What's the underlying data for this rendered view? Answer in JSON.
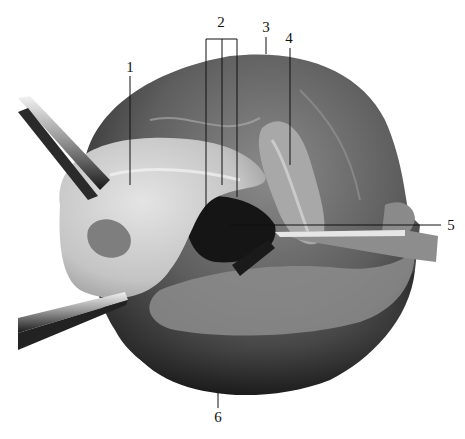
{
  "figure": {
    "type": "anatomical-photograph",
    "colors": {
      "background": "#ffffff",
      "label_line": "#111111"
    },
    "labels": [
      {
        "id": "1",
        "text": "1",
        "x": 130,
        "y": 60
      },
      {
        "id": "2",
        "text": "2",
        "x": 221,
        "y": 14
      },
      {
        "id": "3",
        "text": "3",
        "x": 266,
        "y": 20
      },
      {
        "id": "4",
        "text": "4",
        "x": 289,
        "y": 32
      },
      {
        "id": "5",
        "text": "5",
        "x": 451,
        "y": 219
      },
      {
        "id": "6",
        "text": "6",
        "x": 218,
        "y": 411
      }
    ]
  }
}
